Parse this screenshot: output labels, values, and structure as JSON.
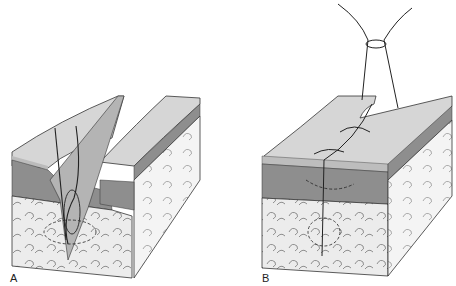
{
  "figure": {
    "panels": [
      {
        "label": "A",
        "description": "Skin block with open wound gap; suture needle path through dermis and subcutaneous tissue with dashed circle"
      },
      {
        "label": "B",
        "description": "Skin block with closed wound; interrupted sutures on surface and tied knot above; dashed circles in tissue"
      }
    ],
    "colors": {
      "epidermis": "#c9c9c9",
      "dermis": "#8e8e8e",
      "dermis_dark": "#6f6f6f",
      "subcutaneous": "#e4e4e4",
      "outline": "#333333",
      "background": "#ffffff"
    }
  }
}
